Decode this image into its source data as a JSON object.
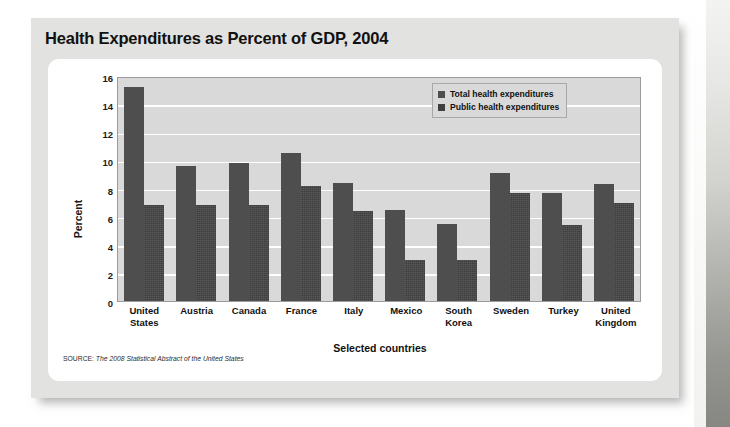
{
  "figure": {
    "title": "Health Expenditures as Percent of GDP, 2004",
    "source_label": "SOURCE:",
    "source_title": "The 2008 Statistical Abstract of the United States"
  },
  "legend": {
    "position": "top-right",
    "items": [
      {
        "label": "Total health expenditures",
        "color": "#4e4e4e",
        "swatch": "legend-swatch-total"
      },
      {
        "label": "Public health expenditures",
        "color": "#3f3f3f",
        "swatch": "legend-swatch-public"
      }
    ]
  },
  "chart_data": {
    "type": "bar",
    "title": "Health Expenditures as Percent of GDP, 2004",
    "xlabel": "Selected countries",
    "ylabel": "Percent",
    "ylim": [
      0,
      16
    ],
    "yticks": [
      0,
      2,
      4,
      6,
      8,
      10,
      12,
      14,
      16
    ],
    "grid": true,
    "legend_position": "top-right",
    "categories": [
      "United States",
      "Austria",
      "Canada",
      "France",
      "Italy",
      "Mexico",
      "South Korea",
      "Sweden",
      "Turkey",
      "United Kingdom"
    ],
    "categories_wrapped": [
      [
        "United",
        "States"
      ],
      [
        "Austria",
        ""
      ],
      [
        "Canada",
        ""
      ],
      [
        "France",
        ""
      ],
      [
        "Italy",
        ""
      ],
      [
        "Mexico",
        ""
      ],
      [
        "South",
        "Korea"
      ],
      [
        "Sweden",
        ""
      ],
      [
        "Turkey",
        ""
      ],
      [
        "United",
        "Kingdom"
      ]
    ],
    "series": [
      {
        "name": "Total health expenditures",
        "color": "#4e4e4e",
        "values": [
          15.2,
          9.6,
          9.8,
          10.5,
          8.4,
          6.5,
          5.5,
          9.1,
          7.7,
          8.3
        ]
      },
      {
        "name": "Public health expenditures",
        "color": "#3f3f3f",
        "values": [
          6.8,
          6.8,
          6.8,
          8.2,
          6.4,
          2.9,
          2.9,
          7.7,
          5.4,
          7.0
        ]
      }
    ]
  }
}
